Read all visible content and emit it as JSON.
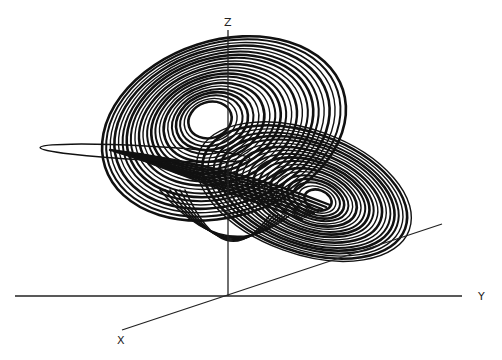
{
  "chart_data": {
    "type": "line",
    "title": "",
    "subtitle": "",
    "axes": {
      "x": {
        "label": "X"
      },
      "y": {
        "label": "Y"
      },
      "z": {
        "label": "Z"
      }
    },
    "ticks": [],
    "grid": false,
    "legend": null,
    "colors": {
      "background": "#ffffff",
      "trajectory": "#111111",
      "axes": "#222222"
    },
    "projection_px": {
      "origin": [
        228,
        296
      ],
      "z_axis_top": [
        228,
        30
      ],
      "y_axis_span": [
        [
          15,
          296
        ],
        [
          462,
          296
        ]
      ],
      "x_axis_span": [
        [
          122,
          330
        ],
        [
          442,
          224
        ]
      ]
    },
    "wings": [
      {
        "name": "upper-left lobe",
        "center_px": [
          210,
          120
        ],
        "rx_range": [
          22,
          125
        ],
        "ry_range": [
          18,
          88
        ],
        "rotation_deg": -18,
        "rings": 22
      },
      {
        "name": "lower-right lobe",
        "center_px": [
          318,
          200
        ],
        "rx_range": [
          14,
          112
        ],
        "ry_range": [
          10,
          62
        ],
        "rotation_deg": 20,
        "rings": 20
      }
    ],
    "stray_loop_px": {
      "center": [
        145,
        153
      ],
      "rx": 105,
      "ry": 7,
      "rotation_deg": 3
    }
  },
  "labels": {
    "x": "X",
    "y": "Y",
    "z": "Z"
  }
}
